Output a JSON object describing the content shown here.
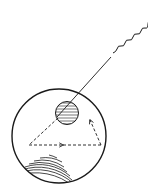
{
  "diagram": {
    "colors": {
      "stroke": "#1a1a1a",
      "background": "#ffffff"
    },
    "elements": {
      "incoming_wave": "wavy light ray",
      "incident_ray": "straight light ray",
      "eyeball": "large circle",
      "lens": "hatched small circle",
      "dashed_path": "dashed triangular path with arrows",
      "retina_arcs": "concentric arcs at bottom-left"
    }
  }
}
